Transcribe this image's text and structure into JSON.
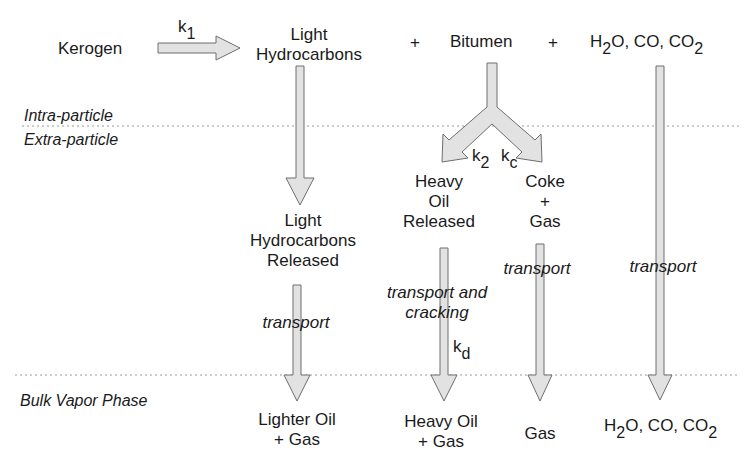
{
  "diagram": {
    "zones": {
      "intra": "Intra-particle",
      "extra": "Extra-particle",
      "bulk": "Bulk Vapor Phase"
    },
    "reactants": {
      "kerogen": "Kerogen",
      "light_hc_line1": "Light",
      "light_hc_line2": "Hydrocarbons",
      "plus1": "+",
      "bitumen": "Bitumen",
      "plus2": "+",
      "gases_h": "H",
      "gases_sub1": "2",
      "gases_rest": "O, CO, CO",
      "gases_sub2": "2"
    },
    "rates": {
      "k1": "k",
      "k1_sub": "1",
      "k2": "k",
      "k2_sub": "2",
      "kc": "k",
      "kc_sub": "c",
      "kd": "k",
      "kd_sub": "d"
    },
    "intermediates": {
      "lhr_line1": "Light",
      "lhr_line2": "Hydrocarbons",
      "lhr_line3": "Released",
      "heavy_line1": "Heavy",
      "heavy_line2": "Oil",
      "heavy_line3": "Released",
      "coke_line1": "Coke",
      "coke_line2": "+",
      "coke_line3": "Gas"
    },
    "processes": {
      "transport_light": "transport",
      "transport_cracking_1": "transport and",
      "transport_cracking_2": "cracking",
      "transport_gas": "transport",
      "transport_co": "transport"
    },
    "products": {
      "lighter_oil_1": "Lighter Oil",
      "lighter_oil_2": "+ Gas",
      "heavy_oil_1": "Heavy Oil",
      "heavy_oil_2": "+ Gas",
      "gas": "Gas",
      "co_h": "H",
      "co_sub1": "2",
      "co_rest": "O, CO, CO",
      "co_sub2": "2"
    },
    "colors": {
      "arrow_fill": "#e2e2e2",
      "arrow_stroke": "#6e6e6e",
      "dotted_line": "#9a9a9a",
      "text": "#1a1a1a"
    }
  }
}
